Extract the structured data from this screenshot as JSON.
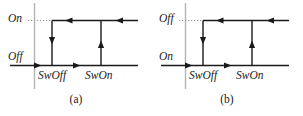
{
  "figure": {
    "type": "hysteresis-switching-diagram",
    "background_color": "#ffffff",
    "stroke_color": "#1a1a1a",
    "axis_color": "#b3b3b3",
    "dotted_color": "#9a9a9a",
    "panels": [
      {
        "id": "a",
        "caption": "(a)",
        "upper_level_label": "On",
        "lower_level_label": "Off",
        "left_threshold_label": "SwOff",
        "right_threshold_label": "SwOn",
        "arrows": [
          {
            "name": "top-right-incoming",
            "direction": "left"
          },
          {
            "name": "top-middle",
            "direction": "left"
          },
          {
            "name": "left-descending",
            "direction": "down"
          },
          {
            "name": "bottom-middle",
            "direction": "right"
          },
          {
            "name": "right-ascending",
            "direction": "up"
          },
          {
            "name": "x-axis-tip",
            "direction": "right"
          }
        ]
      },
      {
        "id": "b",
        "caption": "(b)",
        "upper_level_label": "Off",
        "lower_level_label": "On",
        "left_threshold_label": "SwOff",
        "right_threshold_label": "SwOn",
        "arrows": [
          {
            "name": "top-right-incoming",
            "direction": "left"
          },
          {
            "name": "top-middle",
            "direction": "left"
          },
          {
            "name": "left-descending",
            "direction": "down"
          },
          {
            "name": "bottom-middle",
            "direction": "right"
          },
          {
            "name": "right-ascending",
            "direction": "up"
          },
          {
            "name": "x-axis-tip",
            "direction": "right"
          }
        ]
      }
    ]
  }
}
